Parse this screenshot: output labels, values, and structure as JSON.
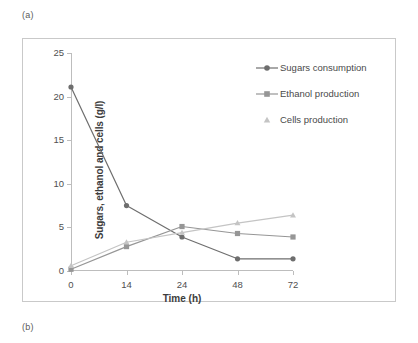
{
  "panels": {
    "a_label": "(a)",
    "b_label": "(b)"
  },
  "chart_data": {
    "type": "line",
    "title": "",
    "xlabel": "Time (h)",
    "ylabel": "Sugars, ethanol and cells (g/l)",
    "categories": [
      "0",
      "14",
      "24",
      "48",
      "72"
    ],
    "x_tick_labels": [
      "0",
      "14",
      "24",
      "48",
      "72"
    ],
    "y_tick_labels": [
      "0",
      "5",
      "10",
      "15",
      "20",
      "25"
    ],
    "y_ticks": [
      0,
      5,
      10,
      15,
      20,
      25
    ],
    "ylim": [
      0,
      25
    ],
    "grid": false,
    "legend_position": "top-right",
    "series": [
      {
        "name": "Sugars consumption",
        "values": [
          21.1,
          7.5,
          3.9,
          1.4,
          1.4
        ],
        "color": "#6e6e6e",
        "marker": "circle"
      },
      {
        "name": "Ethanol production",
        "values": [
          0.2,
          2.8,
          5.1,
          4.3,
          3.9
        ],
        "color": "#969696",
        "marker": "square"
      },
      {
        "name": "Cells production",
        "values": [
          0.6,
          3.3,
          4.4,
          5.5,
          6.4
        ],
        "color": "#c4c4c4",
        "marker": "triangle"
      }
    ]
  }
}
